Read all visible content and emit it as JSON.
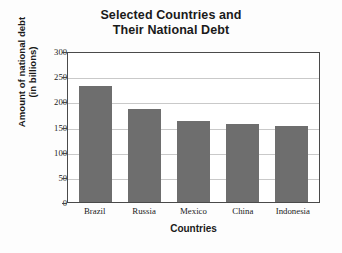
{
  "chart_data": {
    "type": "bar",
    "title": "Selected Countries and Their National Debt",
    "title_lines": [
      "Selected Countries and",
      "Their National Debt"
    ],
    "categories": [
      "Brazil",
      "Russia",
      "Mexico",
      "China",
      "Indonesia"
    ],
    "values": [
      230,
      185,
      160,
      155,
      152
    ],
    "xlabel": "Countries",
    "ylabel": "Amount of national debt (in billions)",
    "ylabel_lines": [
      "Amount of national debt",
      "(in billions)"
    ],
    "ylim": [
      0,
      300
    ],
    "yticks": [
      300,
      250,
      200,
      150,
      100,
      50,
      0
    ],
    "ytick_labels": [
      "300",
      "250",
      "200",
      "150",
      "100",
      "50",
      "0"
    ],
    "grid": true,
    "grid_axis": "y",
    "legend": null,
    "bar_color": "#6e6e6e",
    "plot_background": "#ffffff",
    "frame_color": "#4a4a4a",
    "gridline_color": "#c9c9c9",
    "text_color": "#1a1a1a"
  }
}
